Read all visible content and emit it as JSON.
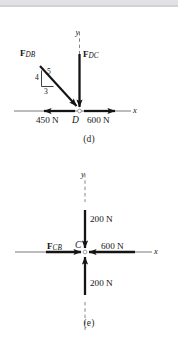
{
  "figure": {
    "colors": {
      "ink": "#141414",
      "axis": "#3a3a3a",
      "page_background": "#ffffff",
      "top_strip": "#e2e2e4"
    }
  },
  "diagram_d": {
    "caption": "(d)",
    "joint_label": "D",
    "axes": {
      "x_label": "x",
      "y_label": "y"
    },
    "forces": [
      {
        "name": "F_DB",
        "symbol": "F",
        "subscript": "DB",
        "label": "F",
        "direction": "down-right (toward D along 3-4-5 slope)",
        "magnitude": ""
      },
      {
        "name": "F_DC",
        "symbol": "F",
        "subscript": "DC",
        "label": "F",
        "direction": "down (toward D)",
        "magnitude": ""
      },
      {
        "name": "left-force",
        "magnitude": "450 N",
        "direction": "left (negative x)"
      },
      {
        "name": "right-force",
        "magnitude": "600 N",
        "direction": "right (positive x)"
      }
    ],
    "slope_triangle": {
      "vertical": "4",
      "hypotenuse": "5",
      "horizontal": "3"
    }
  },
  "diagram_e": {
    "caption": "(e)",
    "joint_label": "C",
    "axes": {
      "x_label": "x",
      "y_label": "y"
    },
    "forces": [
      {
        "name": "F_CB",
        "symbol": "F",
        "subscript": "CB",
        "label": "F",
        "direction": "right (toward C along positive x)",
        "magnitude": ""
      },
      {
        "name": "top-force",
        "magnitude": "200 N",
        "direction": "down (toward C)"
      },
      {
        "name": "bottom-force",
        "magnitude": "200 N",
        "direction": "up (toward C)"
      },
      {
        "name": "right-force",
        "magnitude": "600 N",
        "direction": "left (toward C)"
      }
    ]
  }
}
